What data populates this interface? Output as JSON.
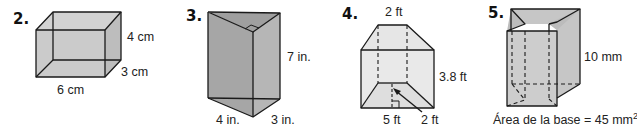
{
  "problems": [
    {
      "number": "2.",
      "shape": "rectangular prism",
      "labels": {
        "height": "4 cm",
        "depth": "3 cm",
        "width": "6 cm"
      }
    },
    {
      "number": "3.",
      "shape": "triangular prism (right triangle base)",
      "labels": {
        "height": "7 in.",
        "leg_a": "4 in.",
        "leg_b": "3 in."
      }
    },
    {
      "number": "4.",
      "shape": "trapezoidal prism",
      "labels": {
        "top_base": "2 ft",
        "length": "3.8 ft",
        "bottom_base": "5 ft",
        "trapezoid_height": "2 ft"
      }
    },
    {
      "number": "5.",
      "shape": "irregular prism",
      "labels": {
        "height": "10 mm",
        "base_area_prefix": "Área de la base = 45 mm",
        "base_area_exponent": "2"
      }
    }
  ],
  "colors": {
    "face_fill": "#c9c9c9",
    "face_fill_dark": "#a9a9a9",
    "face_fill_light": "#e2e2e2",
    "stroke": "#1a1a1a"
  }
}
